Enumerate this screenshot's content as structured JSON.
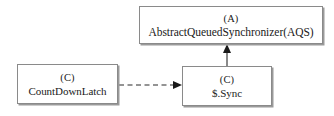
{
  "diagram": {
    "type": "uml-class-diagram",
    "canvas": {
      "width": 334,
      "height": 116,
      "background": "#ffffff"
    },
    "nodes": [
      {
        "id": "aqs",
        "stereotype": "(A)",
        "kind": "abstract-class",
        "name": "AbstractQueuedSynchronizer(AQS)",
        "x": 139,
        "y": 6,
        "width": 184,
        "height": 38,
        "border_color": "#8a8a8a",
        "fill_color": "#ffffff"
      },
      {
        "id": "countdownlatch",
        "stereotype": "(C)",
        "kind": "class",
        "name": "CountDownLatch",
        "x": 17,
        "y": 64,
        "width": 101,
        "height": 40,
        "border_color": "#8a8a8a",
        "fill_color": "#ffffff"
      },
      {
        "id": "sync",
        "stereotype": "(C)",
        "kind": "class",
        "name": "$.Sync",
        "x": 182,
        "y": 66,
        "width": 90,
        "height": 40,
        "border_color": "#8a8a8a",
        "fill_color": "#ffffff"
      }
    ],
    "edges": [
      {
        "id": "edge-cdl-to-sync",
        "from": "countdownlatch",
        "to": "sync",
        "style": "dashed",
        "arrow": "filled-triangle",
        "direction": "right",
        "label": "",
        "color": "#2a2a2a"
      },
      {
        "id": "edge-sync-to-aqs",
        "from": "sync",
        "to": "aqs",
        "style": "solid",
        "arrow": "filled-triangle",
        "direction": "up",
        "label": "",
        "color": "#2a2a2a"
      }
    ]
  }
}
